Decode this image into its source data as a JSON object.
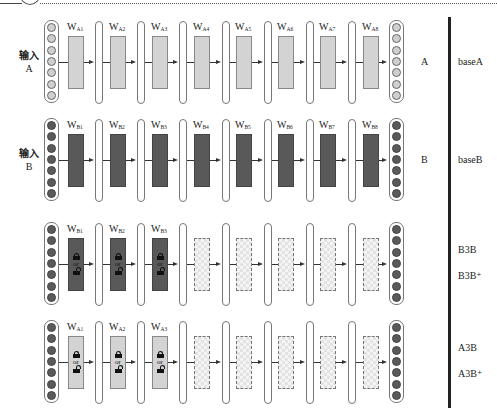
{
  "diagram": {
    "type": "transfer-learning-layer-diagram",
    "rows": [
      {
        "id": "A",
        "input_label": "输入",
        "input_sub": "A",
        "input_style": "light",
        "output_style": "light",
        "result_label": "A",
        "model_labels": [
          "baseA"
        ],
        "layers": [
          {
            "name": "W",
            "sub": "A1",
            "style": "light",
            "lock": false
          },
          {
            "name": "W",
            "sub": "A2",
            "style": "light",
            "lock": false
          },
          {
            "name": "W",
            "sub": "A3",
            "style": "light",
            "lock": false
          },
          {
            "name": "W",
            "sub": "A4",
            "style": "light",
            "lock": false
          },
          {
            "name": "W",
            "sub": "A5",
            "style": "light",
            "lock": false
          },
          {
            "name": "W",
            "sub": "A6",
            "style": "light",
            "lock": false
          },
          {
            "name": "W",
            "sub": "A7",
            "style": "light",
            "lock": false
          },
          {
            "name": "W",
            "sub": "A8",
            "style": "light",
            "lock": false
          }
        ]
      },
      {
        "id": "B",
        "input_label": "输入",
        "input_sub": "B",
        "input_style": "dark",
        "output_style": "dark",
        "result_label": "B",
        "model_labels": [
          "baseB"
        ],
        "layers": [
          {
            "name": "W",
            "sub": "B1",
            "style": "dark",
            "lock": false
          },
          {
            "name": "W",
            "sub": "B2",
            "style": "dark",
            "lock": false
          },
          {
            "name": "W",
            "sub": "B3",
            "style": "dark",
            "lock": false
          },
          {
            "name": "W",
            "sub": "B4",
            "style": "dark",
            "lock": false
          },
          {
            "name": "W",
            "sub": "B5",
            "style": "dark",
            "lock": false
          },
          {
            "name": "W",
            "sub": "B6",
            "style": "dark",
            "lock": false
          },
          {
            "name": "W",
            "sub": "B7",
            "style": "dark",
            "lock": false
          },
          {
            "name": "W",
            "sub": "B8",
            "style": "dark",
            "lock": false
          }
        ]
      },
      {
        "id": "B3B",
        "input_label": "",
        "input_sub": "",
        "input_style": "dark",
        "output_style": "dark",
        "result_label": "",
        "model_labels": [
          "B3B",
          "B3B⁺"
        ],
        "layers": [
          {
            "name": "W",
            "sub": "B1",
            "style": "dark",
            "lock": true
          },
          {
            "name": "W",
            "sub": "B2",
            "style": "dark",
            "lock": true
          },
          {
            "name": "W",
            "sub": "B3",
            "style": "dark",
            "lock": true
          },
          {
            "name": "",
            "sub": "",
            "style": "check",
            "lock": false
          },
          {
            "name": "",
            "sub": "",
            "style": "check",
            "lock": false
          },
          {
            "name": "",
            "sub": "",
            "style": "check",
            "lock": false
          },
          {
            "name": "",
            "sub": "",
            "style": "check",
            "lock": false
          },
          {
            "name": "",
            "sub": "",
            "style": "check",
            "lock": false
          }
        ]
      },
      {
        "id": "A3B",
        "input_label": "",
        "input_sub": "",
        "input_style": "dark",
        "output_style": "dark",
        "result_label": "",
        "model_labels": [
          "A3B",
          "A3B⁺"
        ],
        "layers": [
          {
            "name": "W",
            "sub": "A1",
            "style": "light",
            "lock": true
          },
          {
            "name": "W",
            "sub": "A2",
            "style": "light",
            "lock": true
          },
          {
            "name": "W",
            "sub": "A3",
            "style": "light",
            "lock": true
          },
          {
            "name": "",
            "sub": "",
            "style": "check",
            "lock": false
          },
          {
            "name": "",
            "sub": "",
            "style": "check",
            "lock": false
          },
          {
            "name": "",
            "sub": "",
            "style": "check",
            "lock": false
          },
          {
            "name": "",
            "sub": "",
            "style": "check",
            "lock": false
          },
          {
            "name": "",
            "sub": "",
            "style": "check",
            "lock": false
          }
        ]
      }
    ],
    "lock_or_text": "or",
    "neurons_per_column": 7,
    "colors": {
      "light_fill": "#d3d3d3",
      "dark_fill": "#595959",
      "separator_bar": "#222222"
    }
  }
}
